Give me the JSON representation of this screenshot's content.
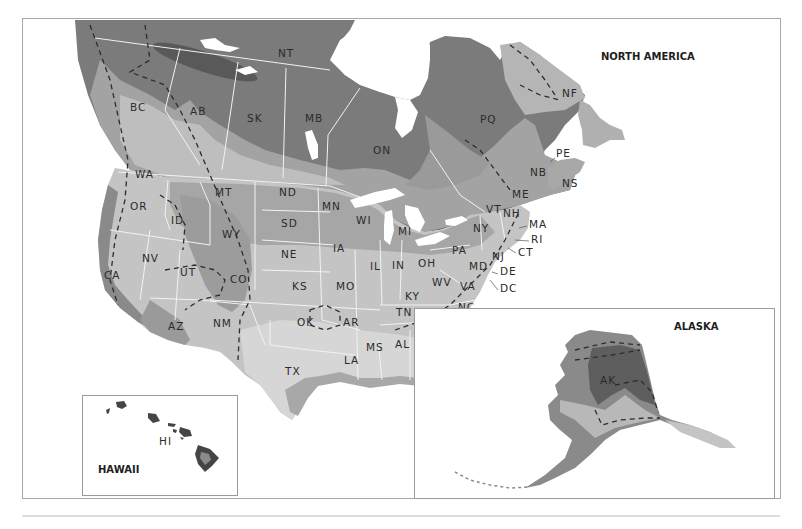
{
  "map": {
    "title": "NORTH AMERICA",
    "colors": {
      "zone_darkest": "#5c5c5c",
      "zone_dark": "#7b7b7b",
      "zone_mid": "#9a9a9a",
      "zone_light": "#b9b9b9",
      "zone_lighter": "#cfcfcf",
      "zone_lightest": "#dedede",
      "water": "#ffffff",
      "frame": "#9a9a9a"
    },
    "canada_labels": [
      {
        "code": "NT",
        "x": 278,
        "y": 57
      },
      {
        "code": "BC",
        "x": 130,
        "y": 111
      },
      {
        "code": "AB",
        "x": 190,
        "y": 115
      },
      {
        "code": "SK",
        "x": 247,
        "y": 122
      },
      {
        "code": "MB",
        "x": 305,
        "y": 122
      },
      {
        "code": "ON",
        "x": 373,
        "y": 154
      },
      {
        "code": "PQ",
        "x": 480,
        "y": 123
      },
      {
        "code": "NF",
        "x": 562,
        "y": 97
      },
      {
        "code": "PE",
        "x": 556,
        "y": 157
      },
      {
        "code": "NB",
        "x": 530,
        "y": 176
      },
      {
        "code": "NS",
        "x": 562,
        "y": 187
      }
    ],
    "us_labels": [
      {
        "code": "WA",
        "x": 135,
        "y": 178
      },
      {
        "code": "OR",
        "x": 130,
        "y": 210
      },
      {
        "code": "ID",
        "x": 171,
        "y": 224
      },
      {
        "code": "MT",
        "x": 215,
        "y": 196
      },
      {
        "code": "WY",
        "x": 222,
        "y": 238
      },
      {
        "code": "ND",
        "x": 279,
        "y": 196
      },
      {
        "code": "SD",
        "x": 281,
        "y": 227
      },
      {
        "code": "MN",
        "x": 322,
        "y": 210
      },
      {
        "code": "WI",
        "x": 356,
        "y": 224
      },
      {
        "code": "MI",
        "x": 398,
        "y": 235
      },
      {
        "code": "NE",
        "x": 281,
        "y": 258
      },
      {
        "code": "IA",
        "x": 333,
        "y": 252
      },
      {
        "code": "NV",
        "x": 142,
        "y": 262
      },
      {
        "code": "UT",
        "x": 180,
        "y": 276
      },
      {
        "code": "CA",
        "x": 104,
        "y": 279
      },
      {
        "code": "CO",
        "x": 230,
        "y": 283
      },
      {
        "code": "KS",
        "x": 292,
        "y": 290
      },
      {
        "code": "MO",
        "x": 336,
        "y": 290
      },
      {
        "code": "IL",
        "x": 370,
        "y": 270
      },
      {
        "code": "IN",
        "x": 392,
        "y": 269
      },
      {
        "code": "OH",
        "x": 418,
        "y": 267
      },
      {
        "code": "KY",
        "x": 405,
        "y": 300
      },
      {
        "code": "WV",
        "x": 432,
        "y": 286
      },
      {
        "code": "VA",
        "x": 460,
        "y": 290
      },
      {
        "code": "PA",
        "x": 452,
        "y": 254
      },
      {
        "code": "NY",
        "x": 473,
        "y": 232
      },
      {
        "code": "VT",
        "x": 486,
        "y": 213
      },
      {
        "code": "NH",
        "x": 503,
        "y": 217
      },
      {
        "code": "ME",
        "x": 512,
        "y": 198
      },
      {
        "code": "MA",
        "x": 529,
        "y": 228
      },
      {
        "code": "RI",
        "x": 531,
        "y": 243
      },
      {
        "code": "CT",
        "x": 518,
        "y": 256
      },
      {
        "code": "NJ",
        "x": 492,
        "y": 260
      },
      {
        "code": "MD",
        "x": 469,
        "y": 270
      },
      {
        "code": "DE",
        "x": 500,
        "y": 275
      },
      {
        "code": "DC",
        "x": 500,
        "y": 292
      },
      {
        "code": "NC",
        "x": 458,
        "y": 311
      },
      {
        "code": "SC",
        "x": 446,
        "y": 330
      },
      {
        "code": "TN",
        "x": 396,
        "y": 316
      },
      {
        "code": "GA",
        "x": 422,
        "y": 347
      },
      {
        "code": "AL",
        "x": 395,
        "y": 348
      },
      {
        "code": "MS",
        "x": 366,
        "y": 351
      },
      {
        "code": "AR",
        "x": 343,
        "y": 326
      },
      {
        "code": "OK",
        "x": 297,
        "y": 326
      },
      {
        "code": "LA",
        "x": 344,
        "y": 364
      },
      {
        "code": "TX",
        "x": 285,
        "y": 375
      },
      {
        "code": "NM",
        "x": 213,
        "y": 327
      },
      {
        "code": "AZ",
        "x": 168,
        "y": 330
      },
      {
        "code": "FL",
        "x": 446,
        "y": 390
      }
    ],
    "alaska": {
      "title": "ALASKA",
      "label": "AK"
    },
    "hawaii": {
      "title": "HAWAII",
      "label": "HI"
    }
  }
}
